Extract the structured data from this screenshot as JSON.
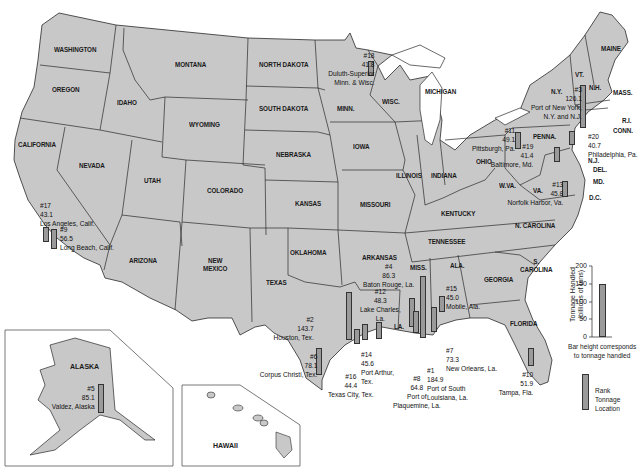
{
  "map": {
    "title": "Top U.S. ports by tonnage handled",
    "colors": {
      "land": "#c8c8c8",
      "border": "#2a2a2a",
      "bar_fill": "#9a9a9a",
      "water": "#ffffff"
    },
    "states": [
      {
        "name": "WASHINGTON",
        "x": 54,
        "y": 46
      },
      {
        "name": "OREGON",
        "x": 52,
        "y": 86
      },
      {
        "name": "CALIFORNIA",
        "x": 18,
        "y": 141
      },
      {
        "name": "IDAHO",
        "x": 117,
        "y": 99
      },
      {
        "name": "NEVADA",
        "x": 79,
        "y": 162
      },
      {
        "name": "MONTANA",
        "x": 175,
        "y": 61
      },
      {
        "name": "WYOMING",
        "x": 189,
        "y": 121
      },
      {
        "name": "UTAH",
        "x": 144,
        "y": 177
      },
      {
        "name": "COLORADO",
        "x": 207,
        "y": 187
      },
      {
        "name": "ARIZONA",
        "x": 129,
        "y": 257
      },
      {
        "name": "NEW\nMEXICO",
        "x": 203,
        "y": 257
      },
      {
        "name": "NORTH DAKOTA",
        "x": 259,
        "y": 61
      },
      {
        "name": "SOUTH DAKOTA",
        "x": 259,
        "y": 105
      },
      {
        "name": "NEBRASKA",
        "x": 276,
        "y": 151
      },
      {
        "name": "KANSAS",
        "x": 295,
        "y": 200
      },
      {
        "name": "OKLAHOMA",
        "x": 290,
        "y": 249
      },
      {
        "name": "TEXAS",
        "x": 266,
        "y": 279
      },
      {
        "name": "MINN.",
        "x": 337,
        "y": 105
      },
      {
        "name": "IOWA",
        "x": 353,
        "y": 143
      },
      {
        "name": "MISSOURI",
        "x": 360,
        "y": 201
      },
      {
        "name": "ARKANSAS",
        "x": 362,
        "y": 254
      },
      {
        "name": "WISC.",
        "x": 382,
        "y": 98
      },
      {
        "name": "ILLINOIS",
        "x": 396,
        "y": 172
      },
      {
        "name": "INDIANA",
        "x": 431,
        "y": 172
      },
      {
        "name": "MICHIGAN",
        "x": 425,
        "y": 88
      },
      {
        "name": "OHIO",
        "x": 476,
        "y": 158
      },
      {
        "name": "KENTUCKY",
        "x": 441,
        "y": 210
      },
      {
        "name": "TENNESSEE",
        "x": 428,
        "y": 238
      },
      {
        "name": "MISS.",
        "x": 410,
        "y": 264
      },
      {
        "name": "ALA.",
        "x": 450,
        "y": 262
      },
      {
        "name": "GEORGIA",
        "x": 484,
        "y": 276
      },
      {
        "name": "LA.",
        "x": 394,
        "y": 323
      },
      {
        "name": "FLORIDA",
        "x": 510,
        "y": 320
      },
      {
        "name": "S.\nCAROLINA",
        "x": 520,
        "y": 258
      },
      {
        "name": "N. CAROLINA",
        "x": 515,
        "y": 222
      },
      {
        "name": "W.VA.",
        "x": 499,
        "y": 182
      },
      {
        "name": "VA.",
        "x": 533,
        "y": 187
      },
      {
        "name": "PENNA.",
        "x": 533,
        "y": 133
      },
      {
        "name": "N.Y.",
        "x": 551,
        "y": 88
      },
      {
        "name": "VT.",
        "x": 575,
        "y": 71
      },
      {
        "name": "N.H.",
        "x": 589,
        "y": 84
      },
      {
        "name": "MAINE",
        "x": 601,
        "y": 45
      },
      {
        "name": "MASS.",
        "x": 613,
        "y": 89
      },
      {
        "name": "R.I.",
        "x": 622,
        "y": 117
      },
      {
        "name": "CONN.",
        "x": 613,
        "y": 127
      },
      {
        "name": "N.J.",
        "x": 588,
        "y": 157
      },
      {
        "name": "DEL.",
        "x": 593,
        "y": 166
      },
      {
        "name": "MD.",
        "x": 593,
        "y": 178
      },
      {
        "name": "D.C.",
        "x": 589,
        "y": 194
      }
    ],
    "insets": [
      {
        "name": "ALASKA",
        "x": 70,
        "y": 363
      },
      {
        "name": "HAWAII",
        "x": 213,
        "y": 442
      }
    ],
    "ports": [
      {
        "rank": "#1",
        "tonnage": "184.9",
        "location": "Port of South\nLouisiana, La.",
        "label_x": 427,
        "label_y": 366,
        "align": "left",
        "bar_x": 420,
        "bar_y": 276,
        "bar_h": 62
      },
      {
        "rank": "#2",
        "tonnage": "143.7",
        "location": "Houston, Tex.",
        "label_x": 268,
        "label_y": 315,
        "align": "right",
        "bar_x": 346,
        "bar_y": 292,
        "bar_h": 48
      },
      {
        "rank": "#3",
        "tonnage": "126.1",
        "location": "Port of New York,\nN.Y. and N.J.",
        "label_x": 524,
        "label_y": 85,
        "align": "right",
        "bar_x": 580,
        "bar_y": 85,
        "bar_h": 43
      },
      {
        "rank": "#4",
        "tonnage": "86.3",
        "location": "Baton Rouge, La.",
        "label_x": 363,
        "label_y": 262,
        "align": "center",
        "bar_x": 409,
        "bar_y": 298,
        "bar_h": 29
      },
      {
        "rank": "#5",
        "tonnage": "85.1",
        "location": "Valdez, Alaska",
        "label_x": 46,
        "label_y": 384,
        "align": "right",
        "bar_x": 98,
        "bar_y": 384,
        "bar_h": 29
      },
      {
        "rank": "#6",
        "tonnage": "78.1",
        "location": "Corpus Christi, Tex.",
        "label_x": 252,
        "label_y": 352,
        "align": "right",
        "bar_x": 316,
        "bar_y": 348,
        "bar_h": 27
      },
      {
        "rank": "#7",
        "tonnage": "73.3",
        "location": "New Orleans, La.",
        "label_x": 446,
        "label_y": 346,
        "align": "left",
        "bar_x": 431,
        "bar_y": 307,
        "bar_h": 25
      },
      {
        "rank": "#8",
        "tonnage": "64.8",
        "location": "Port of\nPlaquemine, La.",
        "label_x": 393,
        "label_y": 374,
        "align": "center",
        "bar_x": 413,
        "bar_y": 311,
        "bar_h": 22
      },
      {
        "rank": "#9",
        "tonnage": "56.5",
        "location": "Long Beach, Calif.",
        "label_x": 60,
        "label_y": 225,
        "align": "left",
        "bar_x": 51,
        "bar_y": 229,
        "bar_h": 20
      },
      {
        "rank": "#10",
        "tonnage": "51.9",
        "location": "Tampa, Fla.",
        "label_x": 494,
        "label_y": 370,
        "align": "right",
        "bar_x": 528,
        "bar_y": 348,
        "bar_h": 18
      },
      {
        "rank": "#11",
        "tonnage": "49.1",
        "location": "Pittsburgh, Pa.",
        "label_x": 466,
        "label_y": 126,
        "align": "right",
        "bar_x": 515,
        "bar_y": 132,
        "bar_h": 17
      },
      {
        "rank": "#12",
        "tonnage": "48.3",
        "location": "Lake Charles,\nLa.",
        "label_x": 360,
        "label_y": 287,
        "align": "center",
        "bar_x": 376,
        "bar_y": 322,
        "bar_h": 17
      },
      {
        "rank": "#13",
        "tonnage": "45.8",
        "location": "Norfolk Harbor, Va.",
        "label_x": 500,
        "label_y": 180,
        "align": "right",
        "bar_x": 562,
        "bar_y": 181,
        "bar_h": 16
      },
      {
        "rank": "#14",
        "tonnage": "45.6",
        "location": "Port Arthur,\nTex.",
        "label_x": 361,
        "label_y": 350,
        "align": "left",
        "bar_x": 362,
        "bar_y": 324,
        "bar_h": 16
      },
      {
        "rank": "#15",
        "tonnage": "45.0",
        "location": "Mobile, Ala.",
        "label_x": 446,
        "label_y": 284,
        "align": "left",
        "bar_x": 439,
        "bar_y": 296,
        "bar_h": 16
      },
      {
        "rank": "#16",
        "tonnage": "44.4",
        "location": "Texas City, Tex.",
        "label_x": 328,
        "label_y": 372,
        "align": "center",
        "bar_x": 354,
        "bar_y": 329,
        "bar_h": 15
      },
      {
        "rank": "#17",
        "tonnage": "43.1",
        "location": "Los Angeles, Calif.",
        "label_x": 40,
        "label_y": 201,
        "align": "left",
        "bar_x": 43,
        "bar_y": 227,
        "bar_h": 15
      },
      {
        "rank": "#18",
        "tonnage": "41.8",
        "location": "Duluth-Superior\nMinn. & Wisc.",
        "label_x": 322,
        "label_y": 51,
        "align": "right",
        "bar_x": 368,
        "bar_y": 61,
        "bar_h": 15
      },
      {
        "rank": "#19",
        "tonnage": "41.4",
        "location": "Baltimore, Md.",
        "label_x": 485,
        "label_y": 142,
        "align": "right",
        "bar_x": 554,
        "bar_y": 147,
        "bar_h": 15
      },
      {
        "rank": "#20",
        "tonnage": "40.7",
        "location": "Philadelphia, Pa.",
        "label_x": 588,
        "label_y": 132,
        "align": "left",
        "bar_x": 569,
        "bar_y": 131,
        "bar_h": 14
      }
    ]
  },
  "legend": {
    "axis_title": "Tonnage Handled\n(billions of tons)",
    "ticks": [
      "200",
      "150",
      "100",
      "50",
      "0"
    ],
    "example_value": 150,
    "caption": "Bar height corresponds\nto tonnage handled",
    "key_lines": "Rank\nTonnage\nLocation"
  }
}
